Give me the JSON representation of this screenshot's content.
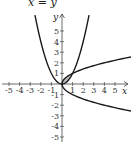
{
  "chart_data": {
    "type": "line",
    "title": "x = y",
    "xlabel": "x",
    "ylabel": "y",
    "xlim": [
      -5.5,
      6.5
    ],
    "ylim": [
      -5.5,
      7.5
    ],
    "grid": false,
    "x_ticks": [
      -5,
      -4,
      -3,
      -2,
      -1,
      1,
      2,
      3,
      4,
      5
    ],
    "y_ticks": [
      -5,
      -4,
      -3,
      -2,
      -1,
      1,
      2,
      3,
      4,
      5
    ],
    "x_tick_labels": [
      "-5",
      "-4",
      "-3",
      "-2",
      "-1",
      "1",
      "2",
      "3",
      "4",
      "5"
    ],
    "y_tick_labels": [
      "-5",
      "-4",
      "-3",
      "-2",
      "-1",
      "1",
      "2",
      "3",
      "4",
      "5"
    ],
    "series": [
      {
        "name": "y = x^2",
        "equation": "y = x^2",
        "x": [
          -2.5,
          -2,
          -1,
          0,
          1,
          2,
          2.5
        ],
        "y": [
          6.25,
          4,
          1,
          0,
          1,
          4,
          6.25
        ]
      },
      {
        "name": "x = y^2",
        "equation": "x = y^2",
        "x": [
          6.25,
          4,
          1,
          0,
          1,
          4,
          6.25
        ],
        "y": [
          -2.5,
          -2,
          -1,
          0,
          1,
          2,
          2.5
        ]
      }
    ],
    "shaded_region": {
      "between": [
        "y = x^2",
        "x = y^2"
      ],
      "x_range": [
        0,
        1
      ],
      "intersections": [
        [
          0,
          0
        ],
        [
          1,
          1
        ]
      ]
    }
  },
  "colors": {
    "curve": "#1a1a1a",
    "axis": "#444444",
    "shade": "#bdbdbd"
  }
}
